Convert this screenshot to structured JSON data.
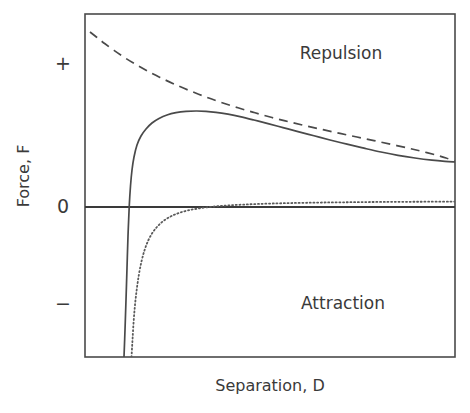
{
  "chart_data": {
    "type": "line",
    "title": "",
    "xlabel": "Separation,    D",
    "ylabel": "Force,  F",
    "xlabel_parts": [
      "Separation,",
      "D"
    ],
    "ylabel_parts": [
      "Force,",
      "F"
    ],
    "grid": false,
    "legend": "none",
    "frame": {
      "x0": 85,
      "y0": 14,
      "x1": 455,
      "y1": 357
    },
    "zero_line_y": 207,
    "xlim": [
      0,
      1
    ],
    "ylim": [
      -1,
      1
    ],
    "y_ticks": [
      {
        "label": "+",
        "y": 63
      },
      {
        "label": "0",
        "y": 205
      },
      {
        "label": "−",
        "y": 304
      }
    ],
    "x_ticks": [],
    "annotations": [
      {
        "text": "Repulsion",
        "x": 341,
        "y": 53
      },
      {
        "text": "Attraction",
        "x": 343,
        "y": 303
      }
    ],
    "series": [
      {
        "name": "Total interaction force (DLVO)",
        "style": "solid",
        "color": "#4a4a4a",
        "points": [
          [
            124.0,
            357.0
          ],
          [
            125.0,
            330.0
          ],
          [
            126.0,
            300.0
          ],
          [
            127.0,
            268.0
          ],
          [
            128.0,
            236.0
          ],
          [
            129.2,
            207.0
          ],
          [
            130.5,
            186.0
          ],
          [
            132.0,
            170.0
          ],
          [
            134.0,
            157.0
          ],
          [
            137.0,
            145.0
          ],
          [
            141.0,
            136.0
          ],
          [
            146.0,
            129.0
          ],
          [
            152.0,
            123.0
          ],
          [
            159.0,
            118.5
          ],
          [
            167.0,
            115.0
          ],
          [
            176.0,
            112.7
          ],
          [
            186.0,
            111.4
          ],
          [
            196.0,
            111.0
          ],
          [
            206.0,
            111.3
          ],
          [
            216.0,
            112.3
          ],
          [
            228.0,
            114.2
          ],
          [
            240.0,
            116.6
          ],
          [
            254.0,
            120.0
          ],
          [
            268.0,
            123.6
          ],
          [
            283.0,
            127.6
          ],
          [
            298.0,
            131.6
          ],
          [
            314.0,
            135.8
          ],
          [
            330.0,
            140.0
          ],
          [
            347.0,
            144.2
          ],
          [
            364.0,
            148.2
          ],
          [
            381.0,
            152.0
          ],
          [
            398.0,
            155.3
          ],
          [
            415.0,
            158.0
          ],
          [
            432.0,
            160.2
          ],
          [
            445.0,
            161.4
          ],
          [
            455.0,
            162.0
          ]
        ]
      },
      {
        "name": "Electrostatic double-layer repulsion",
        "style": "dashed",
        "color": "#4a4a4a",
        "points": [
          [
            90.0,
            32.0
          ],
          [
            97.0,
            37.5
          ],
          [
            105.0,
            43.8
          ],
          [
            114.0,
            50.4
          ],
          [
            124.0,
            57.2
          ],
          [
            135.0,
            64.0
          ],
          [
            147.0,
            70.8
          ],
          [
            160.0,
            77.4
          ],
          [
            174.0,
            84.0
          ],
          [
            189.0,
            90.4
          ],
          [
            205.0,
            96.6
          ],
          [
            221.0,
            102.3
          ],
          [
            238.0,
            107.8
          ],
          [
            255.0,
            112.8
          ],
          [
            272.0,
            117.5
          ],
          [
            289.0,
            121.8
          ],
          [
            306.0,
            125.9
          ],
          [
            323.0,
            129.7
          ],
          [
            340.0,
            133.4
          ],
          [
            357.0,
            137.0
          ],
          [
            374.0,
            140.6
          ],
          [
            391.0,
            144.3
          ],
          [
            408.0,
            148.1
          ],
          [
            422.0,
            151.4
          ],
          [
            436.0,
            155.0
          ],
          [
            446.0,
            158.0
          ],
          [
            455.0,
            161.4
          ]
        ]
      },
      {
        "name": "Van der Waals attraction",
        "style": "dotted",
        "color": "#5a5a5a",
        "points": [
          [
            131.5,
            357.0
          ],
          [
            132.5,
            340.0
          ],
          [
            133.6,
            322.0
          ],
          [
            135.0,
            305.0
          ],
          [
            136.8,
            289.0
          ],
          [
            139.0,
            274.0
          ],
          [
            141.6,
            261.0
          ],
          [
            144.6,
            250.0
          ],
          [
            148.0,
            241.0
          ],
          [
            152.0,
            233.5
          ],
          [
            156.5,
            227.5
          ],
          [
            161.5,
            222.5
          ],
          [
            167.0,
            218.5
          ],
          [
            173.0,
            215.3
          ],
          [
            180.0,
            212.6
          ],
          [
            188.0,
            210.4
          ],
          [
            197.0,
            208.7
          ],
          [
            207.0,
            207.3
          ],
          [
            218.0,
            206.2
          ],
          [
            230.0,
            205.3
          ],
          [
            243.0,
            204.6
          ],
          [
            257.0,
            204.0
          ],
          [
            272.0,
            203.5
          ],
          [
            288.0,
            203.1
          ],
          [
            305.0,
            202.8
          ],
          [
            323.0,
            202.5
          ],
          [
            342.0,
            202.3
          ],
          [
            362.0,
            202.1
          ],
          [
            383.0,
            201.9
          ],
          [
            405.0,
            201.8
          ],
          [
            428.0,
            201.7
          ],
          [
            455.0,
            201.6
          ]
        ]
      }
    ]
  },
  "axis_titles": {
    "y_title": "Force,  F",
    "x_title": "Separation,    D"
  },
  "colors": {
    "frame": "#4a4a4a",
    "zero_line": "#3a3a3a",
    "text": "#3a3a3a",
    "background": "#ffffff"
  }
}
